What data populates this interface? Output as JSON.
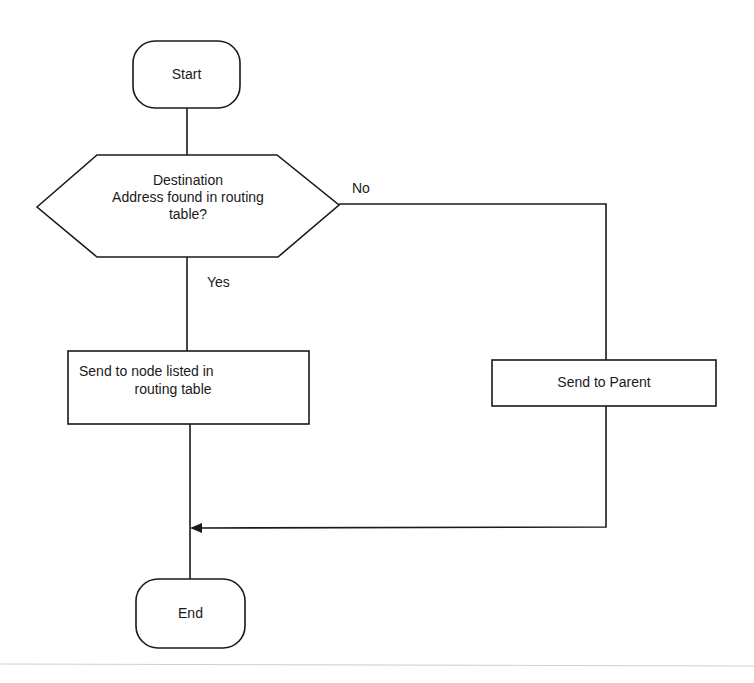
{
  "diagram": {
    "type": "flowchart",
    "colors": {
      "stroke": "#1a1a1a",
      "background": "#ffffff",
      "baseline": "#cfcfcf"
    },
    "nodes": {
      "start": {
        "label": "Start",
        "shape": "terminator"
      },
      "decision": {
        "line1": "Destination",
        "line2": "Address found in routing",
        "line3": "table?",
        "shape": "hexagon"
      },
      "send_node": {
        "line1": "Send to node listed in",
        "line2": "routing table",
        "shape": "process"
      },
      "send_parent": {
        "label": "Send to Parent",
        "shape": "process"
      },
      "end": {
        "label": "End",
        "shape": "terminator"
      }
    },
    "edges": {
      "no_label": "No",
      "yes_label": "Yes"
    }
  }
}
